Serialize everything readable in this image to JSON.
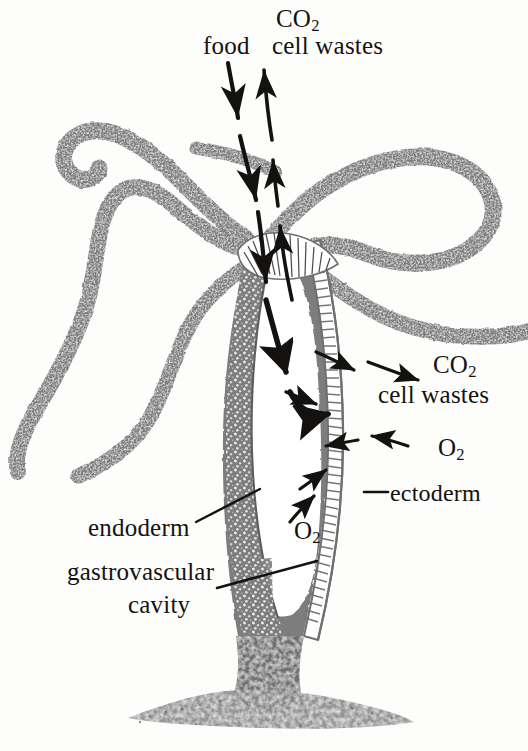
{
  "figure": {
    "colors": {
      "tissue_gray": "#7d7d7d",
      "tissue_gray_dark": "#6f6f6f",
      "ink_black": "#141210",
      "background": "#fdfdfc",
      "cavity_white": "#ffffff"
    }
  },
  "labels": {
    "co2_top": "CO",
    "co2_top_sub": "2",
    "food": "food",
    "cell_wastes_top": "cell wastes",
    "co2_right": "CO",
    "co2_right_sub": "2",
    "cell_wastes_right": "cell wastes",
    "o2_right": "O",
    "o2_right_sub": "2",
    "ectoderm": "ectoderm",
    "endoderm": "endoderm",
    "o2_mid": "O",
    "o2_mid_sub": "2",
    "gastrovascular": "gastrovascular",
    "cavity": "cavity"
  },
  "leader_lines": [
    {
      "name": "ectoderm-leader",
      "from": [
        390,
        492
      ],
      "to": [
        366,
        492
      ]
    },
    {
      "name": "endoderm-leader",
      "from": [
        196,
        520
      ],
      "to": [
        256,
        491
      ]
    },
    {
      "name": "gastrovascular-cavity-leader",
      "from": [
        217,
        586
      ],
      "to": [
        315,
        561
      ]
    }
  ],
  "flow_arrows": [
    {
      "name": "food-intake-arrow",
      "direction": "down",
      "substance": "food",
      "path": "mouth-into-cavity"
    },
    {
      "name": "cell-wastes-out-arrow",
      "direction": "up",
      "substance": "CO2 and cell wastes",
      "path": "cavity-through-mouth"
    },
    {
      "name": "cavity-circulation-arrow",
      "direction": "clockwise-down",
      "substance": "food",
      "path": "inside-gastrovascular-cavity"
    },
    {
      "name": "co2-out-upper-arrow",
      "direction": "outward-right",
      "substance": "CO2 and cell wastes",
      "path": "through-body-wall"
    },
    {
      "name": "co2-out-lower-arrow",
      "direction": "outward-right",
      "substance": "CO2 and cell wastes",
      "path": "through-body-wall"
    },
    {
      "name": "o2-in-arrow",
      "direction": "inward-left",
      "substance": "O2",
      "path": "through-body-wall"
    },
    {
      "name": "o2-in-cavity-arrow-upper",
      "direction": "inward-up-left",
      "substance": "O2",
      "path": "into-cavity"
    },
    {
      "name": "o2-in-cavity-arrow-lower",
      "direction": "inward-up-left",
      "substance": "O2",
      "path": "into-cavity"
    }
  ],
  "anatomy": [
    {
      "name": "tentacle-upper-left",
      "kind": "tentacle"
    },
    {
      "name": "tentacle-mid-left",
      "kind": "tentacle"
    },
    {
      "name": "tentacle-lower-left",
      "kind": "tentacle"
    },
    {
      "name": "tentacle-upper-right",
      "kind": "tentacle"
    },
    {
      "name": "tentacle-lower-right",
      "kind": "tentacle"
    },
    {
      "name": "hypostome-mouth",
      "kind": "mouth"
    },
    {
      "name": "body-column",
      "kind": "body"
    },
    {
      "name": "gastrovascular-cavity",
      "kind": "cavity"
    },
    {
      "name": "endoderm-layer",
      "kind": "tissue-layer"
    },
    {
      "name": "ectoderm-layer",
      "kind": "tissue-layer"
    },
    {
      "name": "basal-disc-foot",
      "kind": "foot"
    },
    {
      "name": "substrate",
      "kind": "ground"
    }
  ]
}
